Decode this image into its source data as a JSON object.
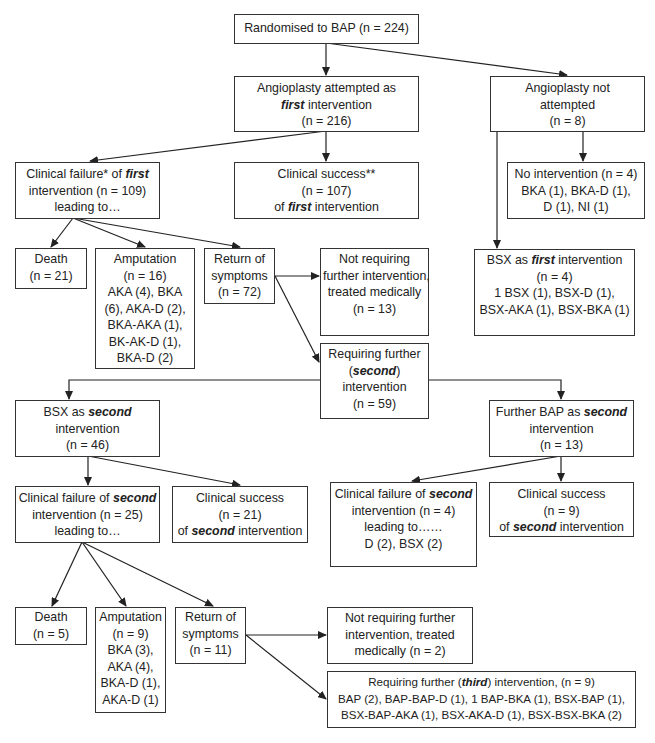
{
  "diagram": {
    "type": "flowchart",
    "nodes": {
      "randomised": {
        "lines": [
          "Randomised to BAP (n = 224)"
        ]
      },
      "angio_attempted": {
        "lines": [
          "Angioplasty attempted as",
          "[first] intervention",
          "(n = 216)"
        ]
      },
      "angio_not_attempted": {
        "lines": [
          "Angioplasty not",
          "attempted",
          "(n = 8)"
        ]
      },
      "failure_first": {
        "lines": [
          "Clinical failure* of [first]",
          "intervention (n = 109)",
          "leading to…"
        ]
      },
      "success_first": {
        "lines": [
          "Clinical success**",
          "(n = 107)",
          "of [first] intervention"
        ]
      },
      "no_intervention": {
        "lines": [
          "No intervention (n = 4)",
          "BKA (1), BKA-D (1),",
          "D (1), NI (1)"
        ]
      },
      "death_1": {
        "lines": [
          "Death",
          "(n = 21)"
        ]
      },
      "amputation_1": {
        "lines": [
          "Amputation",
          "(n = 16)",
          "AKA (4), BKA",
          "(6), AKA-D (2),",
          "BKA-AKA (1),",
          "BK-AK-D (1),",
          "BKA-D (2)"
        ]
      },
      "return_1": {
        "lines": [
          "Return of",
          "symptoms",
          "(n = 72)"
        ]
      },
      "not_requiring_1": {
        "lines": [
          "Not requiring",
          "further intervention,",
          "treated medically",
          "(n = 13)"
        ]
      },
      "bsx_first": {
        "lines": [
          "BSX as [first] intervention",
          "(n = 4)",
          "1 BSX (1), BSX-D (1),",
          "BSX-AKA (1), BSX-BKA (1)"
        ]
      },
      "requiring_second": {
        "lines": [
          "Requiring further",
          "([second])",
          "intervention",
          "(n = 59)"
        ]
      },
      "bsx_second": {
        "lines": [
          "BSX as [second]",
          "intervention",
          "(n = 46)"
        ]
      },
      "bap_second": {
        "lines": [
          "Further BAP as [second]",
          "intervention",
          "(n = 13)"
        ]
      },
      "failure_second_bsx": {
        "lines": [
          "Clinical failure of [second]",
          "intervention (n = 25)",
          "leading to…"
        ]
      },
      "success_second_bsx": {
        "lines": [
          "Clinical success",
          "(n = 21)",
          "of [second] intervention"
        ]
      },
      "failure_second_bap": {
        "lines": [
          "Clinical failure of [second]",
          "intervention (n = 4)",
          "leading to……",
          "D (2), BSX (2)"
        ]
      },
      "success_second_bap": {
        "lines": [
          "Clinical success",
          "(n = 9)",
          "of [second] intervention"
        ]
      },
      "death_2": {
        "lines": [
          "Death",
          "(n = 5)"
        ]
      },
      "amputation_2": {
        "lines": [
          "Amputation",
          "(n = 9)",
          "BKA (3),",
          "AKA (4),",
          "BKA-D (1),",
          "AKA-D (1)"
        ]
      },
      "return_2": {
        "lines": [
          "Return of",
          "symptoms",
          "(n = 11)"
        ]
      },
      "not_requiring_2": {
        "lines": [
          "Not requiring further",
          "intervention, treated",
          "medically (n = 2)"
        ]
      },
      "requiring_third": {
        "lines": [
          "Requiring further ([third]) intervention, (n = 9)",
          "BAP (2), BAP-BAP-D (1), 1 BAP-BKA (1), BSX-BAP (1),",
          "BSX-BAP-AKA (1), BSX-AKA-D (1), BSX-BSX-BKA (2)"
        ]
      }
    },
    "colors": {
      "line": "#222222",
      "border": "#333333",
      "background": "#ffffff"
    }
  }
}
